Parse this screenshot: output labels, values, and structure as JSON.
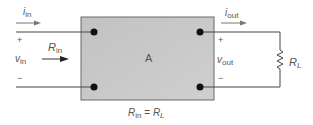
{
  "diagram": {
    "block_label": "A",
    "input": {
      "current_label": "i",
      "current_sub": "in",
      "voltage_label": "v",
      "voltage_sub": "in",
      "resistance_label": "R",
      "resistance_sub": "in",
      "plus": "+",
      "minus": "−"
    },
    "output": {
      "current_label": "i",
      "current_sub": "out",
      "voltage_label": "v",
      "voltage_sub": "out",
      "plus": "+",
      "minus": "−"
    },
    "load": {
      "label": "R",
      "sub": "L"
    },
    "condition": {
      "lhs": "R",
      "lhs_sub": "in",
      "eq": " = ",
      "rhs": "R",
      "rhs_sub": "L"
    },
    "colors": {
      "block_fill": "#c6c6c6",
      "block_border": "#6a6a6a",
      "wire": "#444444",
      "terminal": "#111111",
      "text": "#555555"
    }
  }
}
